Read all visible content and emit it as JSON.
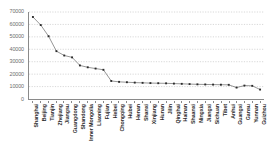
{
  "chart_data": {
    "type": "line",
    "title": "",
    "subtitle": "",
    "xlabel": "",
    "ylabel": "",
    "ylim": [
      0,
      70000
    ],
    "ytick_values": [
      0,
      10000,
      20000,
      30000,
      40000,
      50000,
      60000,
      70000
    ],
    "ytick_labels": [
      "0",
      "10000",
      "20000",
      "30000",
      "40000",
      "50000",
      "60000",
      "70000"
    ],
    "grid": true,
    "grid_axis": "y",
    "grid_style": "dotted",
    "legend": false,
    "legend_position": "none",
    "marker": "square",
    "categories": [
      "Shanghai",
      "Beijing",
      "Tianjin",
      "Zhejiang",
      "Jiangsu",
      "Guangdong",
      "Shandong",
      "Inner Mongolia",
      "Liaoning",
      "Fujian",
      "Hebei",
      "Chongqing",
      "Hubei",
      "Henan",
      "Shanxi",
      "Xinjiang",
      "Hunan",
      "Jilin",
      "Qinghai",
      "Hainan",
      "Shaanxi",
      "Ningxia",
      "Jiangxi",
      "Sichuan",
      "Tibet",
      "Anhui",
      "Guangxi",
      "Gansu",
      "Yunnan",
      "Guizhou"
    ],
    "series": [
      {
        "name": "Value",
        "values": [
          66000,
          59500,
          50500,
          38500,
          35000,
          33500,
          27000,
          25500,
          24500,
          23500,
          14500,
          13800,
          13500,
          13200,
          13000,
          12800,
          12700,
          12600,
          12400,
          12200,
          12000,
          11800,
          11700,
          11600,
          11500,
          11400,
          9200,
          10800,
          10600,
          7600
        ]
      }
    ],
    "colors": {
      "line": "#7a7a7a",
      "marker": "#2b2b2b",
      "grid": "#bdbdbd",
      "axis": "#8a8a8a",
      "ytick_text": "#6d6d6d",
      "xtick_text": "#2b2b2b",
      "background": "#ffffff"
    }
  }
}
